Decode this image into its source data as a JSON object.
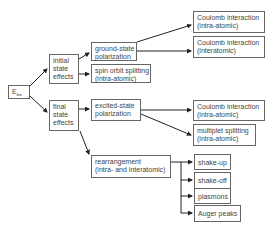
{
  "diagram": {
    "root": {
      "label": "E",
      "subscript": "bin"
    },
    "initial": {
      "lines": [
        "initial",
        "state",
        "effects"
      ]
    },
    "final": {
      "lines": [
        "final",
        "state",
        "effects"
      ]
    },
    "ground_state": {
      "lines": [
        "ground-state",
        "polarization"
      ]
    },
    "spin_orbit": {
      "lines": [
        "spin orbit splitting",
        "(intra-atomic)"
      ]
    },
    "coulomb_intra_1": {
      "lines": [
        "Coulomb interaction",
        "(intra-atomic)"
      ]
    },
    "coulomb_inter": {
      "lines": [
        "Coulomb interaction",
        "(interatomic)"
      ]
    },
    "excited_state": {
      "lines": [
        "excited-state",
        "polarization"
      ]
    },
    "coulomb_intra_2": {
      "lines": [
        "Coulomb interaction",
        "(intra-atomic)"
      ]
    },
    "multiplet": {
      "lines": [
        "multiplet splitting",
        "(intra-atomic)"
      ]
    },
    "rearrangement": {
      "lines": [
        "rearrangement",
        "(intra- and interatomic)"
      ]
    },
    "shake_up": {
      "label": "shake-up"
    },
    "shake_off": {
      "label": "shake-off"
    },
    "plasmons": {
      "label": "plasmons"
    },
    "auger": {
      "label": "Auger peaks"
    }
  },
  "colors": {
    "line": "#222222",
    "border": "#666666",
    "text": "#444444"
  }
}
